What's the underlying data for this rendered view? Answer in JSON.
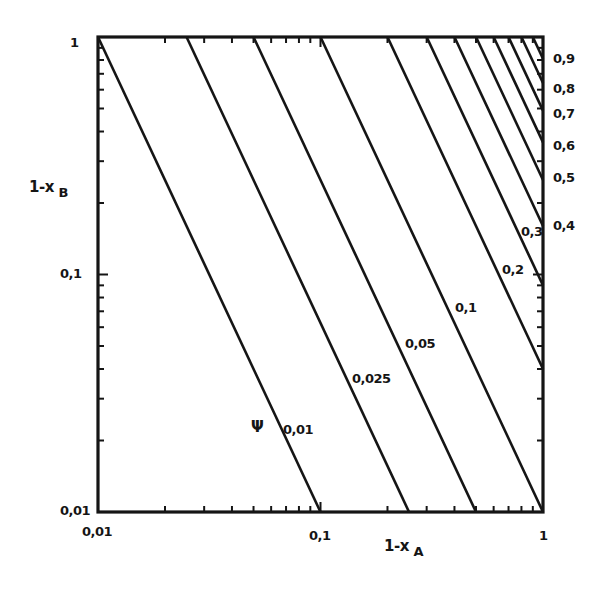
{
  "chart_data": {
    "type": "line",
    "title": "",
    "xlabel": "1-x_A",
    "ylabel": "1-x_B",
    "xscale": "log",
    "yscale": "log",
    "xlim": [
      0.01,
      1
    ],
    "ylim": [
      0.01,
      1
    ],
    "grid": false,
    "legend": "none",
    "parameter_symbol": "Ψ",
    "relation": "(1-x_A)^2 (1-x_B) = Ψ^2",
    "x_tick_labels": [
      "0,01",
      "0,1",
      "1"
    ],
    "y_tick_labels": [
      "0,01",
      "0,1",
      "1"
    ],
    "series": [
      {
        "name": "0,01",
        "psi": 0.01,
        "x": [
          0.01,
          0.1
        ],
        "y": [
          1,
          0.01
        ]
      },
      {
        "name": "0,025",
        "psi": 0.025,
        "x": [
          0.025,
          0.25
        ],
        "y": [
          1,
          0.01
        ]
      },
      {
        "name": "0,05",
        "psi": 0.05,
        "x": [
          0.05,
          0.5
        ],
        "y": [
          1,
          0.01
        ]
      },
      {
        "name": "0,1",
        "psi": 0.1,
        "x": [
          0.1,
          1
        ],
        "y": [
          1,
          0.01
        ]
      },
      {
        "name": "0,2",
        "psi": 0.2,
        "x": [
          0.2,
          1
        ],
        "y": [
          1,
          0.04
        ]
      },
      {
        "name": "0,3",
        "psi": 0.3,
        "x": [
          0.3,
          1
        ],
        "y": [
          1,
          0.09
        ]
      },
      {
        "name": "0,4",
        "psi": 0.4,
        "x": [
          0.4,
          1
        ],
        "y": [
          1,
          0.16
        ]
      },
      {
        "name": "0,5",
        "psi": 0.5,
        "x": [
          0.5,
          1
        ],
        "y": [
          1,
          0.25
        ]
      },
      {
        "name": "0,6",
        "psi": 0.6,
        "x": [
          0.6,
          1
        ],
        "y": [
          1,
          0.36
        ]
      },
      {
        "name": "0,7",
        "psi": 0.7,
        "x": [
          0.7,
          1
        ],
        "y": [
          1,
          0.49
        ]
      },
      {
        "name": "0,8",
        "psi": 0.8,
        "x": [
          0.8,
          1
        ],
        "y": [
          1,
          0.64
        ]
      },
      {
        "name": "0,9",
        "psi": 0.9,
        "x": [
          0.9,
          1
        ],
        "y": [
          1,
          0.81
        ]
      }
    ],
    "inline_labels": [
      "0,01",
      "0,025",
      "0,05",
      "0,1",
      "0,2",
      "0,3"
    ],
    "right_edge_labels": [
      "0,4",
      "0,5",
      "0,6",
      "0,7",
      "0,8",
      "0,9"
    ]
  },
  "labels": {
    "y_axis_title_main": "1-x",
    "y_axis_title_sub": "B",
    "x_axis_title_main": "1-x",
    "x_axis_title_sub": "A",
    "psi": "Ψ",
    "y_tick_1": "1",
    "y_tick_01": "0,1",
    "y_tick_001": "0,01",
    "x_tick_001": "0,01",
    "x_tick_01": "0,1",
    "x_tick_1": "1",
    "line_001": "0,01",
    "line_0025": "0,025",
    "line_005": "0,05",
    "line_01": "0,1",
    "line_02": "0,2",
    "line_03": "0,3",
    "edge_04": "0,4",
    "edge_05": "0,5",
    "edge_06": "0,6",
    "edge_07": "0,7",
    "edge_08": "0,8",
    "edge_09": "0,9"
  },
  "style": {
    "ink": "#151515",
    "background": "#ffffff"
  }
}
